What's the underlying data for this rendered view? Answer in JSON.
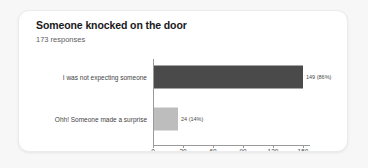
{
  "card": {
    "title": "Someone knocked on the door",
    "subtitle": "173 responses"
  },
  "colors": {
    "page_background": "#f7f7f7",
    "card_background": "#ffffff",
    "bar_primary": "#4a4a4a",
    "bar_secondary": "#bdbdbd",
    "axis": "#9a9a9a",
    "title_text": "#19191c",
    "subtitle_text": "#5d5d61"
  },
  "chart_data": {
    "type": "bar",
    "orientation": "horizontal",
    "title": "Someone knocked on the door",
    "subtitle": "173 responses",
    "xlabel": "",
    "ylabel": "",
    "xlim": [
      0,
      157
    ],
    "axis_max_tick": 150,
    "grid": false,
    "legend": false,
    "total_responses": 173,
    "categories": [
      "I was not expecting someone",
      "Ohh! Someone made a surprise"
    ],
    "values": [
      149,
      24
    ],
    "percents": [
      "86%",
      "14%"
    ],
    "data_labels": [
      "149 (86%)",
      "24 (14%)"
    ],
    "bar_colors": [
      "#4a4a4a",
      "#bdbdbd"
    ],
    "ticks": [
      0,
      30,
      60,
      90,
      120,
      150
    ],
    "tick_labels": [
      "0",
      "30",
      "60",
      "90",
      "120",
      "150"
    ]
  }
}
